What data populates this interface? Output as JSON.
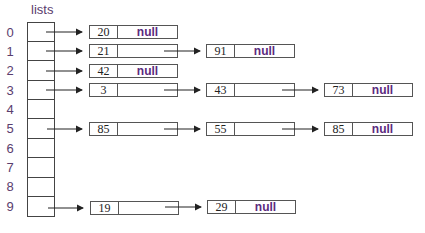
{
  "title": "lists",
  "indices": [
    "0",
    "1",
    "2",
    "3",
    "4",
    "5",
    "6",
    "7",
    "8",
    "9"
  ],
  "null_label": "null",
  "nodes": {
    "r0a": "20",
    "r1a": "21",
    "r1b": "91",
    "r2a": "42",
    "r3a": "3",
    "r3b": "43",
    "r3c": "73",
    "r5a": "85",
    "r5b": "55",
    "r5c": "85",
    "r9a": "19",
    "r9b": "29"
  },
  "colors": {
    "text": "#5a3d6e",
    "null": "#5b2a7e",
    "border": "#555555"
  }
}
